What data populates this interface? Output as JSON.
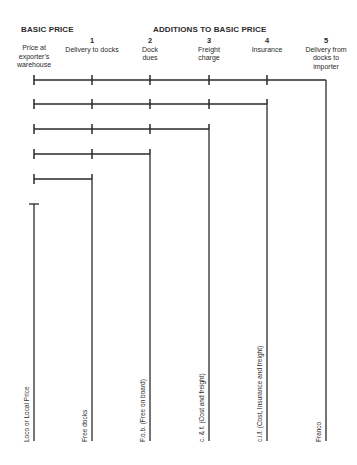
{
  "header": {
    "basic_price": "BASIC PRICE",
    "additions": "ADDITIONS TO BASIC PRICE"
  },
  "columns": [
    {
      "num": "",
      "label": "Price at exporter's warehouse",
      "x": 34
    },
    {
      "num": "1",
      "label": "Delivery to docks",
      "x": 92
    },
    {
      "num": "2",
      "label": "Dock dues",
      "x": 150
    },
    {
      "num": "3",
      "label": "Freight charge",
      "x": 209
    },
    {
      "num": "4",
      "label": "Insurance",
      "x": 267
    },
    {
      "num": "5",
      "label": "Delivery from docks to importer",
      "x": 326
    }
  ],
  "terms": [
    {
      "label": "Loco or Local Price",
      "x": 34
    },
    {
      "label": "Free docks",
      "x": 92
    },
    {
      "label": "F.o.b. (Free on board)",
      "x": 150
    },
    {
      "label": "c. & f. (Cost and freight)",
      "x": 209
    },
    {
      "label": "c.i.f. (Cost, Insurance and freight)",
      "x": 267
    },
    {
      "label": "Franco",
      "x": 326
    }
  ],
  "colors": {
    "ink": "#2a2a2a",
    "background": "#ffffff"
  }
}
